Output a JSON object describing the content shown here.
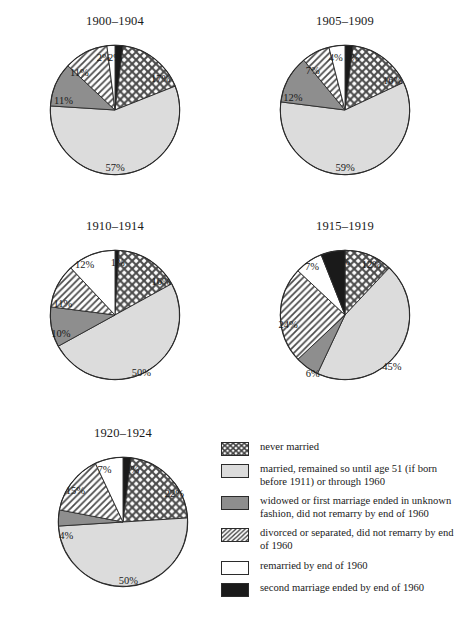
{
  "figure": {
    "background": "#ffffff",
    "outline_color": "#2b2b2b"
  },
  "palette": {
    "never_married": "#ffffff",
    "never_married_pattern": "crosshatch",
    "married_remained": "#dcdcdc",
    "widowed_unknown": "#8e8e8e",
    "divorced_separated_pattern": "diagonal-hatch",
    "remarried": "#ffffff",
    "second_marriage_ended": "#1a1a1a",
    "stroke": "#2b2b2b",
    "text": "#1a1a1a"
  },
  "legend": {
    "items": [
      {
        "key": "never_married",
        "swatch": "crosshatch-swatch",
        "label": "never married"
      },
      {
        "key": "married_remained",
        "swatch": "light-gray-swatch",
        "label": "married, remained so until age 51 (if born before 1911) or through 1960"
      },
      {
        "key": "widowed_unknown",
        "swatch": "dark-gray-swatch",
        "label": "widowed or first marriage ended in unknown fashion, did not remarry by end of 1960"
      },
      {
        "key": "divorced_separated",
        "swatch": "diagonal-hatch-swatch",
        "label": "divorced or separated, did not remarry by end of 1960"
      },
      {
        "key": "remarried",
        "swatch": "white-swatch",
        "label": "remarried by end of 1960"
      },
      {
        "key": "second_marriage_ended",
        "swatch": "black-swatch",
        "label": "second marriage ended by end of 1960"
      }
    ]
  },
  "chart_data": [
    {
      "type": "pie",
      "title": "1900–1904",
      "categories": [
        "second marriage ended by end of 1960",
        "never married",
        "married, remained so until age 51 (if born before 1911) or through 1960",
        "widowed or first marriage ended in unknown fashion, did not remarry by end of 1960",
        "divorced or separated, did not remarry by end of 1960",
        "remarried by end of 1960"
      ],
      "keys": [
        "second_marriage_ended",
        "never_married",
        "married_remained",
        "widowed_unknown",
        "divorced_separated",
        "remarried"
      ],
      "values": [
        2,
        17,
        57,
        11,
        11,
        2
      ],
      "labels": [
        "2%",
        "17%",
        "57%",
        "11%",
        "11%",
        "2%"
      ],
      "start_angle_deg": 0,
      "direction": "clockwise",
      "label_positions": [
        {
          "x": 50.0,
          "y": 10.0
        },
        {
          "x": 84.5,
          "y": 26.0
        },
        {
          "x": 50.0,
          "y": 93.5
        },
        {
          "x": 11.0,
          "y": 42.5
        },
        {
          "x": 23.0,
          "y": 21.5
        },
        {
          "x": 41.5,
          "y": 10.0
        }
      ]
    },
    {
      "type": "pie",
      "title": "1905–1909",
      "categories": [
        "second marriage ended by end of 1960",
        "never married",
        "married, remained so until age 51 (if born before 1911) or through 1960",
        "widowed or first marriage ended in unknown fashion, did not remarry by end of 1960",
        "divorced or separated, did not remarry by end of 1960",
        "remarried by end of 1960"
      ],
      "keys": [
        "second_marriage_ended",
        "never_married",
        "married_remained",
        "widowed_unknown",
        "divorced_separated",
        "remarried"
      ],
      "values": [
        2,
        16,
        59,
        12,
        7,
        4
      ],
      "labels": [
        "2%",
        "16%",
        "59%",
        "12%",
        "7%",
        "4%"
      ],
      "start_angle_deg": 0,
      "direction": "clockwise",
      "label_positions": [
        {
          "x": 55.5,
          "y": 10.0
        },
        {
          "x": 86.0,
          "y": 27.0
        },
        {
          "x": 50.0,
          "y": 93.5
        },
        {
          "x": 10.5,
          "y": 40.5
        },
        {
          "x": 25.5,
          "y": 19.5
        },
        {
          "x": 43.0,
          "y": 10.0
        }
      ]
    },
    {
      "type": "pie",
      "title": "1910–1914",
      "categories": [
        "second marriage ended by end of 1960",
        "never married",
        "married, remained so until age 51 (if born before 1911) or through 1960",
        "widowed or first marriage ended in unknown fashion, did not remarry by end of 1960",
        "divorced or separated, did not remarry by end of 1960",
        "remarried by end of 1960"
      ],
      "keys": [
        "second_marriage_ended",
        "never_married",
        "married_remained",
        "widowed_unknown",
        "divorced_separated",
        "remarried"
      ],
      "values": [
        1,
        16,
        50,
        10,
        11,
        12
      ],
      "labels": [
        "1%",
        "16%",
        "50%",
        "10%",
        "11%",
        "12%"
      ],
      "start_angle_deg": 0,
      "direction": "clockwise",
      "label_positions": [
        {
          "x": 52.0,
          "y": 9.5
        },
        {
          "x": 85.0,
          "y": 24.0
        },
        {
          "x": 70.0,
          "y": 93.5
        },
        {
          "x": 9.0,
          "y": 64.0
        },
        {
          "x": 10.5,
          "y": 41.0
        },
        {
          "x": 27.0,
          "y": 11.5
        }
      ]
    },
    {
      "type": "pie",
      "title": "1915–1919",
      "categories": [
        "never married",
        "married, remained so until age 51 (if born before 1911) or through 1960",
        "widowed or first marriage ended in unknown fashion, did not remarry by end of 1960",
        "divorced or separated, did not remarry by end of 1960",
        "remarried by end of 1960",
        "second marriage ended by end of 1960"
      ],
      "keys": [
        "never_married",
        "married_remained",
        "widowed_unknown",
        "divorced_separated",
        "remarried",
        "second_marriage_ended"
      ],
      "values": [
        12,
        45,
        6,
        24,
        7,
        6
      ],
      "labels": [
        "12%",
        "45%",
        "6%",
        "24%",
        "7%",
        "6%"
      ],
      "start_angle_deg": 0,
      "direction": "clockwise",
      "label_positions": [
        {
          "x": 70.0,
          "y": 11.0
        },
        {
          "x": 85.5,
          "y": 89.0
        },
        {
          "x": 25.5,
          "y": 94.0
        },
        {
          "x": 7.0,
          "y": 57.0
        },
        {
          "x": 25.0,
          "y": 12.5
        },
        {
          "x": 48.5,
          "y": 9.0
        }
      ]
    },
    {
      "type": "pie",
      "title": "1920–1924",
      "categories": [
        "second marriage ended by end of 1960",
        "never married",
        "married, remained so until age 51 (if born before 1911) or through 1960",
        "widowed or first marriage ended in unknown fashion, did not remarry by end of 1960",
        "divorced or separated, did not remarry by end of 1960",
        "remarried by end of 1960"
      ],
      "keys": [
        "second_marriage_ended",
        "never_married",
        "married_remained",
        "widowed_unknown",
        "divorced_separated",
        "remarried"
      ],
      "values": [
        2,
        22,
        50,
        4,
        15,
        7
      ],
      "labels": [
        "2%",
        "22%",
        "50%",
        "4%",
        "15%",
        "7%"
      ],
      "start_angle_deg": 0,
      "direction": "clockwise",
      "label_positions": [
        {
          "x": 57.0,
          "y": 10.0
        },
        {
          "x": 89.0,
          "y": 28.0
        },
        {
          "x": 54.0,
          "y": 94.0
        },
        {
          "x": 7.0,
          "y": 60.0
        },
        {
          "x": 14.0,
          "y": 25.5
        },
        {
          "x": 36.0,
          "y": 10.0
        }
      ]
    }
  ]
}
